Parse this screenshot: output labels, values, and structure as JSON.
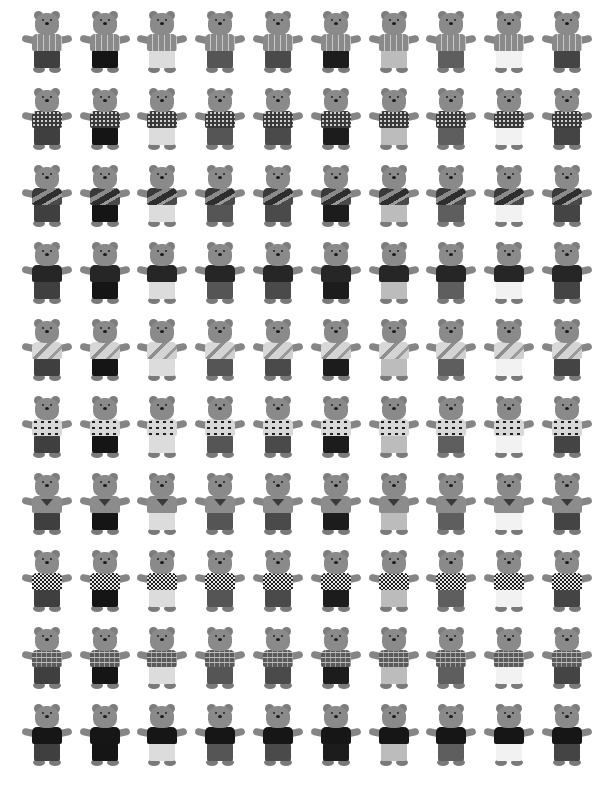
{
  "image": {
    "description": "Grid of 100 teddy bears photographed in grayscale, 10 rows by 10 columns; each row shares a shirt pattern, each column a pants shade",
    "rows": 10,
    "columns": 10
  },
  "shirts": [
    {
      "name": "striped",
      "bg": "#8e8e8e",
      "pattern": "repeating-linear-gradient(90deg,#8a8a8a 0 5px,#c8c8c8 5px 6px)"
    },
    {
      "name": "polka-dot",
      "bg": "#3a3a3a",
      "pattern": "radial-gradient(circle,#cfcfcf 0.8px,transparent 1.2px) 0 0/4px 4px,#3a3a3a"
    },
    {
      "name": "camo-wave",
      "bg": "#5a5a5a",
      "pattern": "linear-gradient(150deg,#3a3a3a 0 30%,#8a8a8a 30% 45%,#2e2e2e 45% 65%,#9a9a9a 65% 75%,#4a4a4a 75%)"
    },
    {
      "name": "dark-solid",
      "bg": "#262626",
      "pattern": "#262626"
    },
    {
      "name": "light-print",
      "bg": "#c9c9c9",
      "pattern": "linear-gradient(135deg,#d8d8d8 0 35%,#8e8e8e 35% 45%,#d4d4d4 45% 70%,#9a9a9a 70% 78%,#cfcfcf 78%)"
    },
    {
      "name": "animal-print",
      "bg": "#d8d8d8",
      "pattern": "radial-gradient(ellipse 3px 2px,#1f1f1f 60%,transparent 70%) 0 0/7px 6px,#d8d8d8"
    },
    {
      "name": "emblem",
      "bg": "#8c8c8c",
      "pattern": "linear-gradient(#8c8c8c,#8c8c8c)"
    },
    {
      "name": "houndstooth",
      "bg": "#e0e0e0",
      "pattern": "repeating-conic-gradient(#1e1e1e 0 25%,#e6e6e6 0 50%) 0 0/4px 4px"
    },
    {
      "name": "plaid",
      "bg": "#6a6a6a",
      "pattern": "repeating-linear-gradient(0deg,transparent 0 4px,#bdbdbd 4px 5px),repeating-linear-gradient(90deg,#5a5a5a 0 4px,#9a9a9a 4px 5px)"
    },
    {
      "name": "black",
      "bg": "#161616",
      "pattern": "#161616"
    }
  ],
  "pants": [
    {
      "name": "dark-grey",
      "color": "#3f3f3f"
    },
    {
      "name": "black",
      "color": "#151515"
    },
    {
      "name": "cream",
      "color": "#dcdcdc"
    },
    {
      "name": "grey",
      "color": "#555555"
    },
    {
      "name": "charcoal",
      "color": "#4a4a4a"
    },
    {
      "name": "black-2",
      "color": "#1c1c1c"
    },
    {
      "name": "light-grey",
      "color": "#bcbcbc"
    },
    {
      "name": "medium-grey",
      "color": "#5e5e5e"
    },
    {
      "name": "white",
      "color": "#f2f2f2"
    },
    {
      "name": "slate",
      "color": "#444444"
    }
  ]
}
